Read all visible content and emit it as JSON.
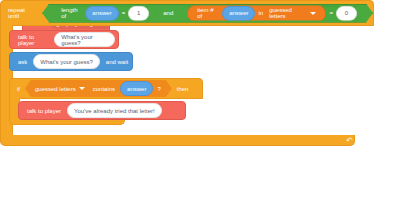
{
  "editor": {
    "background_color": "#ffffff",
    "type": "block-code-editor"
  },
  "palette_colors": {
    "hat_red": "#f4695c",
    "control_orange": "#f5a623",
    "operator_green": "#4aa93f",
    "variable_blue": "#5ba4e5",
    "sensing_blue": "#4c97d8",
    "list_orange": "#f07c1e"
  },
  "script": {
    "define": {
      "keyword": "define",
      "procedure_name": "get player's guess"
    },
    "repeat_until": {
      "keyword": "repeat until",
      "condition": {
        "operator": "and",
        "left": {
          "operator": "=",
          "left_label": "length of",
          "left_variable": "answer",
          "right_value": "1"
        },
        "right": {
          "operator": "=",
          "list_label": "item # of",
          "list_variable": "answer",
          "in_label": "in",
          "list_name": "guessed letters",
          "right_value": "0"
        }
      },
      "loop_arrow_icon": "loop-arrow-icon"
    },
    "body": [
      {
        "type": "talk",
        "label": "talk to player",
        "value": "What's your guess?"
      },
      {
        "type": "ask",
        "label": "ask",
        "value": "What's your guess?",
        "trailing_label": "and wait"
      },
      {
        "type": "if",
        "keyword": "if",
        "then_label": "then",
        "condition": {
          "list_name": "guessed letters",
          "predicate": "contains",
          "variable": "answer",
          "question_mark": "?"
        },
        "children": [
          {
            "type": "talk",
            "label": "talk to player",
            "value": "You've already tried that letter!"
          }
        ]
      }
    ]
  }
}
